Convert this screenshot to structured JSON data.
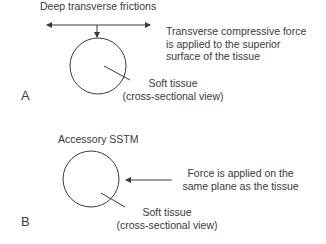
{
  "panel_a": {
    "title": "Deep transverse frictions",
    "force_note": [
      "Transverse compressive force",
      "is applied to the superior",
      "surface of the tissue"
    ],
    "tissue_label": [
      "Soft tissue",
      "(cross-sectional view)"
    ],
    "letter": "A"
  },
  "panel_b": {
    "title": "Accessory SSTM",
    "force_note": [
      "Force is applied on the",
      "same plane as the tissue"
    ],
    "tissue_label": [
      "Soft tissue",
      "(cross-sectional view)"
    ],
    "letter": "B"
  },
  "colors": {
    "stroke": "#3a3a3a",
    "background": "#ffffff"
  }
}
